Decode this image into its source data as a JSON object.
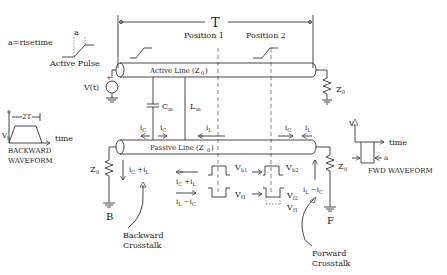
{
  "diagram": {
    "title_period": "T",
    "risetime_label": "a=risetime",
    "risetime_marker": "a",
    "active_pulse_label": "Active Pulse",
    "position1": "Position  1",
    "position2": "Position  2",
    "active_line": "Active Line (Z",
    "active_line_sub": "0",
    "passive_line": "Passive Line (Z",
    "passive_line_sub": "0",
    "source_label": "V(t)",
    "plus": "+",
    "minus": "−",
    "z0": "Z",
    "z0_sub": "0",
    "cm": "C",
    "cm_sub": "m",
    "lm": "L",
    "lm_sub": "m",
    "ic": "i",
    "ic_sub": "C",
    "il": "i",
    "il_sub": "L",
    "ic_plus_il": "i",
    "backward_node": "B",
    "forward_node": "F",
    "backward_crosstalk": [
      "Backward",
      "Crosstalk"
    ],
    "forward_crosstalk": [
      "Forward",
      "Crosstalk"
    ],
    "backward_waveform": {
      "title": [
        "BACKWARD",
        "WAVEFORM"
      ],
      "width_label": "2T",
      "amp_label": "V",
      "amp_sub": "b",
      "axis": "time"
    },
    "fwd_waveform": {
      "title": "FWD  WAVEFORM",
      "amp_label": "V",
      "width_label": "a",
      "axis": "time"
    },
    "vb1": "V",
    "vb1_sub": "b1",
    "vb2": "V",
    "vb2_sub": "b2",
    "vf1": "V",
    "vf1_sub": "f1",
    "vf2": "V",
    "vf2_sub": "f2",
    "label_ic_plus_il": "i",
    "label_il_minus_ic": "i",
    "label_il_minus_ic_fwd": "i"
  }
}
